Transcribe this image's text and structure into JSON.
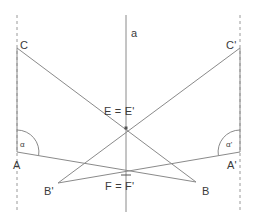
{
  "figure": {
    "kind": "geometry-diagram",
    "width": 255,
    "height": 223,
    "background_color": "#ffffff",
    "stroke_color": "#8a8a8a",
    "text_color": "#3a3a3a"
  },
  "labels": {
    "axis": "a",
    "vertex_C": "C",
    "vertex_C_prime": "C'",
    "vertex_A": "A",
    "vertex_A_prime": "A'",
    "vertex_B": "B",
    "vertex_B_prime": "B'",
    "point_E": "E = E'",
    "point_F": "F = F'",
    "angle_alpha": "α",
    "angle_alpha_prime": "α'"
  },
  "geometry": {
    "points": {
      "C": {
        "x": 17,
        "y": 48
      },
      "A": {
        "x": 17,
        "y": 152
      },
      "C_prime": {
        "x": 240,
        "y": 48
      },
      "A_prime": {
        "x": 240,
        "y": 152
      },
      "B": {
        "x": 196,
        "y": 182
      },
      "B_prime": {
        "x": 58,
        "y": 183
      },
      "E": {
        "x": 126,
        "y": 128
      },
      "F": {
        "x": 126,
        "y": 175
      }
    },
    "axis_line": {
      "x": 126,
      "y_top": 15,
      "y_bottom": 212
    },
    "dashed_guides": [
      {
        "x": 17,
        "y_top": 15,
        "y_bottom": 212
      },
      {
        "x": 240,
        "y_top": 15,
        "y_bottom": 212
      }
    ],
    "segments": [
      {
        "name": "left-vertical-CA",
        "from": "C",
        "to": "A"
      },
      {
        "name": "right-vertical-CA",
        "from": "C_prime",
        "to": "A_prime"
      },
      {
        "name": "C-to-B",
        "from": "C",
        "to": "B"
      },
      {
        "name": "Cprime-to-Bprime",
        "from": "C_prime",
        "to": "B_prime"
      },
      {
        "name": "A-to-B",
        "from": "A",
        "to": "B"
      },
      {
        "name": "Aprime-to-Bprime",
        "from": "A_prime",
        "to": "B_prime"
      }
    ],
    "angle_arcs": [
      {
        "name": "alpha",
        "at": "A",
        "radius": 22
      },
      {
        "name": "alpha-prime",
        "at": "A_prime",
        "radius": 22
      }
    ],
    "marked_points": [
      "E",
      "F"
    ]
  },
  "label_positions": {
    "axis": {
      "left": 131,
      "top": 28
    },
    "vertex_C": {
      "left": 20,
      "top": 40
    },
    "vertex_C_prime": {
      "left": 226,
      "top": 40
    },
    "vertex_A": {
      "left": 13,
      "top": 160
    },
    "vertex_A_prime": {
      "left": 227,
      "top": 160
    },
    "vertex_B": {
      "left": 202,
      "top": 186
    },
    "vertex_B_prime": {
      "left": 44,
      "top": 186
    },
    "point_E": {
      "left": 104,
      "top": 106
    },
    "point_F": {
      "left": 105,
      "top": 181
    },
    "angle_alpha": {
      "left": 20,
      "top": 141
    },
    "angle_alpha_prime": {
      "left": 226,
      "top": 141
    }
  }
}
